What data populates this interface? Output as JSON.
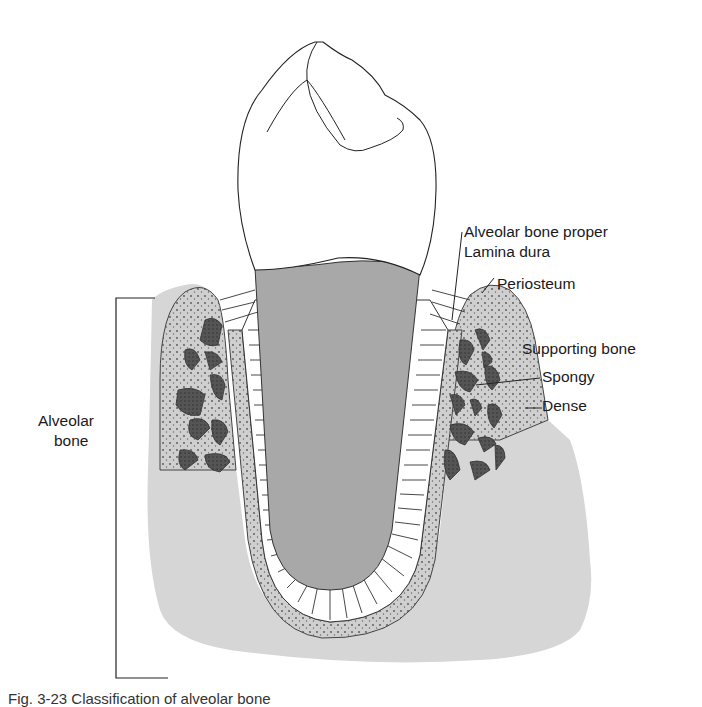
{
  "figure": {
    "labels": {
      "alveolar_bone_proper": "Alveolar bone proper",
      "lamina_dura": "Lamina dura",
      "periosteum": "Periosteum",
      "supporting_bone": "Supporting bone",
      "spongy": "Spongy",
      "dense": "Dense",
      "alveolar_bone_line1": "Alveolar",
      "alveolar_bone_line2": "bone"
    },
    "caption": "Fig. 3-23 Classification of alveolar bone",
    "colors": {
      "bone_gray": "#d6d6d6",
      "root_gray": "#a8a8a8",
      "cortical_gray": "#c9c9c9",
      "trabecula_dark": "#4a4a4a",
      "line": "#2a2a2a"
    }
  }
}
